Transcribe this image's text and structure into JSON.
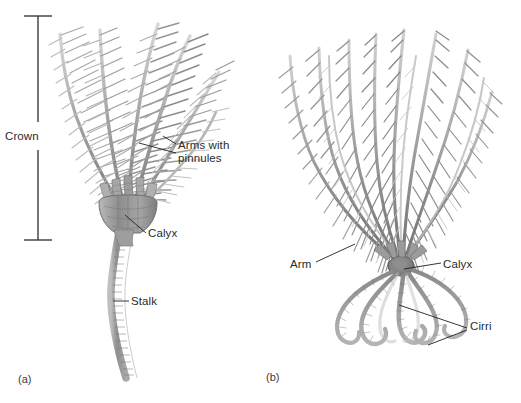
{
  "figure": {
    "background_color": "#ffffff",
    "ink_color": "#2b2b2b",
    "organism_gray_light": "#c9c9c9",
    "organism_gray_mid": "#9a9a9a",
    "organism_gray_dark": "#6e6e6e"
  },
  "panels": [
    {
      "id": "a",
      "caption": "(a)",
      "subject": "stalked sea lily crinoid",
      "labels": [
        {
          "name": "crown",
          "text": "Crown",
          "kind": "bracket-label"
        },
        {
          "name": "arms-with-pinnules",
          "text": "Arms with\npinnules",
          "line1": "Arms with",
          "line2": "pinnules",
          "kind": "leader-label"
        },
        {
          "name": "calyx",
          "text": "Calyx",
          "kind": "leader-label"
        },
        {
          "name": "stalk",
          "text": "Stalk",
          "kind": "leader-label"
        }
      ]
    },
    {
      "id": "b",
      "caption": "(b)",
      "subject": "free-swimming feather star crinoid",
      "labels": [
        {
          "name": "arm",
          "text": "Arm",
          "kind": "leader-label"
        },
        {
          "name": "calyx",
          "text": "Calyx",
          "kind": "leader-label"
        },
        {
          "name": "cirri",
          "text": "Cirri",
          "kind": "leader-label"
        }
      ]
    }
  ],
  "label_text": {
    "crown": "Crown",
    "arms_with_pinnules_line1": "Arms with",
    "arms_with_pinnules_line2": "pinnules",
    "calyx_a": "Calyx",
    "stalk": "Stalk",
    "arm_b": "Arm",
    "calyx_b": "Calyx",
    "cirri": "Cirri",
    "caption_a": "(a)",
    "caption_b": "(b)"
  }
}
